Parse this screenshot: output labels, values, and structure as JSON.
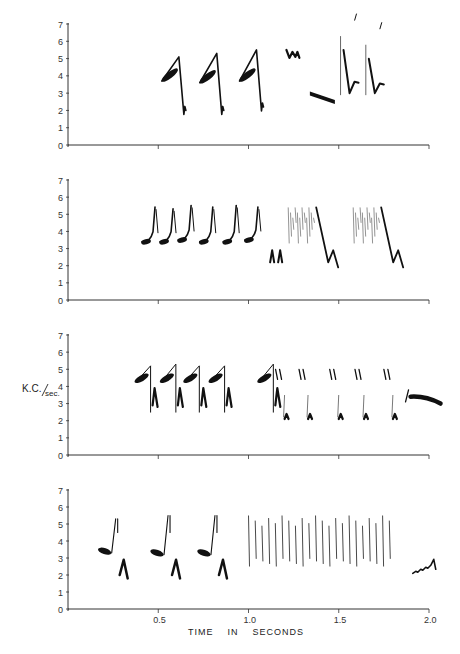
{
  "chart_data": {
    "type": "spectrogram",
    "title": "",
    "xlabel": "TIME IN SECONDS",
    "ylabel": "K.C./sec.",
    "xlim": [
      0,
      2.0
    ],
    "ylim": [
      0,
      7
    ],
    "x_ticks": [
      0.5,
      1.0,
      1.5,
      2.0
    ],
    "x_tick_labels": [
      "0.5",
      "1.0",
      "1.5",
      "2.0"
    ],
    "y_ticks": [
      0,
      1,
      2,
      3,
      4,
      5,
      6,
      7
    ],
    "y_tick_labels": [
      "0",
      "1",
      "2",
      "3",
      "4",
      "5",
      "6",
      "7"
    ],
    "grid": false,
    "panels": [
      {
        "id": 1,
        "notes": [
          {
            "shape": "rising-blob-then-drop",
            "t": 0.52,
            "f_start": 3.7,
            "f_peak": 5.1,
            "f_end": 2.0
          },
          {
            "shape": "rising-blob-then-drop",
            "t": 0.73,
            "f_start": 3.6,
            "f_peak": 5.3,
            "f_end": 2.0
          },
          {
            "shape": "rising-blob-then-drop",
            "t": 0.95,
            "f_start": 3.7,
            "f_peak": 5.5,
            "f_end": 2.2
          },
          {
            "shape": "zigzag",
            "t": 1.21,
            "f_start": 5.5,
            "f_end": 5.0
          },
          {
            "shape": "descending-band",
            "t": 1.34,
            "f_start": 3.1,
            "f_end": 2.6
          },
          {
            "shape": "spike-dip-rise",
            "t": 1.51,
            "f_peak": 6.3,
            "f_low": 3.0,
            "f_end": 3.6
          },
          {
            "shape": "spike-dip-rise",
            "t": 1.65,
            "f_peak": 5.8,
            "f_low": 3.0,
            "f_end": 3.5
          }
        ]
      },
      {
        "id": 2,
        "notes": [
          {
            "shape": "hook",
            "t": 0.41,
            "f_start": 3.4,
            "f_peak": 5.3
          },
          {
            "shape": "hook",
            "t": 0.51,
            "f_start": 3.4,
            "f_peak": 5.2
          },
          {
            "shape": "hook",
            "t": 0.61,
            "f_start": 3.5,
            "f_peak": 5.4
          },
          {
            "shape": "hook",
            "t": 0.73,
            "f_start": 3.4,
            "f_peak": 5.3
          },
          {
            "shape": "hook",
            "t": 0.86,
            "f_start": 3.4,
            "f_peak": 5.4
          },
          {
            "shape": "hook",
            "t": 0.98,
            "f_start": 3.5,
            "f_peak": 5.3
          },
          {
            "shape": "double-arch",
            "t": 1.12,
            "f_start": 2.2,
            "f_peak": 2.9
          },
          {
            "shape": "comb-then-sweep",
            "t": 1.22,
            "f_top": 5.4,
            "f_low": 2.2
          },
          {
            "shape": "comb-then-sweep",
            "t": 1.58,
            "f_top": 5.4,
            "f_low": 2.2
          }
        ]
      },
      {
        "id": 3,
        "notes": [
          {
            "shape": "rise-drop-arch",
            "t": 0.38,
            "f_start": 4.3,
            "f_peak": 5.2
          },
          {
            "shape": "rise-drop-arch",
            "t": 0.52,
            "f_start": 4.3,
            "f_peak": 5.3
          },
          {
            "shape": "rise-drop-arch",
            "t": 0.65,
            "f_start": 4.3,
            "f_peak": 5.2
          },
          {
            "shape": "rise-drop-arch",
            "t": 0.79,
            "f_start": 4.3,
            "f_peak": 5.2
          },
          {
            "shape": "rise-drop-arch",
            "t": 1.06,
            "f_start": 4.3,
            "f_peak": 5.3
          },
          {
            "shape": "double-tick",
            "t": 1.15,
            "f_high": 5.0
          },
          {
            "shape": "double-tick",
            "t": 1.28,
            "f_high": 5.0
          },
          {
            "shape": "double-tick",
            "t": 1.45,
            "f_high": 5.0
          },
          {
            "shape": "double-tick",
            "t": 1.59,
            "f_high": 5.0
          },
          {
            "shape": "double-tick",
            "t": 1.75,
            "f_high": 5.0
          },
          {
            "shape": "long-band",
            "t": 1.87,
            "f_start": 3.4,
            "f_end": 3.0
          }
        ]
      },
      {
        "id": 4,
        "notes": [
          {
            "shape": "flat-rise-arch",
            "t": 0.17,
            "f_start": 3.6,
            "f_peak": 5.3
          },
          {
            "shape": "flat-rise-arch",
            "t": 0.46,
            "f_start": 3.5,
            "f_peak": 5.5
          },
          {
            "shape": "flat-rise-arch",
            "t": 0.72,
            "f_start": 3.5,
            "f_peak": 5.5
          },
          {
            "shape": "trill",
            "t_start": 1.0,
            "t_end": 1.78,
            "f_top": 5.5,
            "f_bottom": 2.5,
            "count": 22
          },
          {
            "shape": "rising-scatter",
            "t": 1.91,
            "f_start": 2.1,
            "f_end": 3.6
          }
        ]
      }
    ]
  },
  "panels": [
    {
      "y0": 145,
      "y7": 24
    },
    {
      "y0": 300,
      "y7": 180
    },
    {
      "y0": 455,
      "y7": 335
    },
    {
      "y0": 609,
      "y7": 490
    }
  ],
  "axes": {
    "x_origin_px": 68,
    "x_end_px": 429,
    "y_tick_labels": [
      "0",
      "1",
      "2",
      "3",
      "4",
      "5",
      "6",
      "7"
    ],
    "x_tick_labels": [
      "0.5",
      "1.0",
      "1.5",
      "2.0"
    ],
    "ylabel_main": "K.C.",
    "ylabel_sub": "sec.",
    "xlabel": "TIME    IN    SECONDS"
  },
  "colors": {
    "ink": "#111111",
    "axis": "#333333",
    "background": "#ffffff"
  }
}
